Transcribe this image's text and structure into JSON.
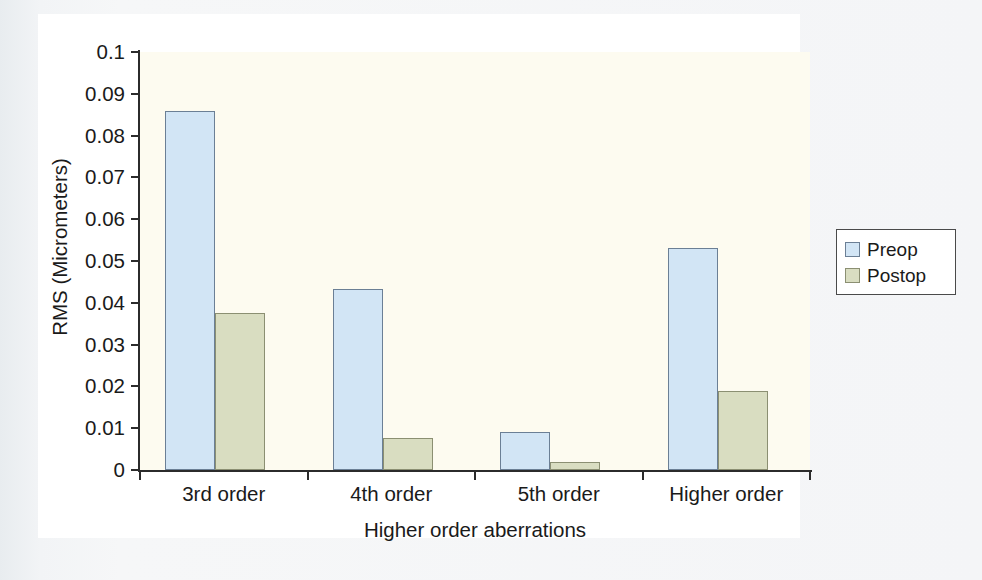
{
  "chart_data": {
    "type": "bar",
    "title": "",
    "xlabel": "Higher order aberrations",
    "ylabel": "RMS (Micrometers)",
    "categories": [
      "3rd order",
      "4th order",
      "5th order",
      "Higher order"
    ],
    "series": [
      {
        "name": "Preop",
        "color": "#d2e5f5",
        "values": [
          0.086,
          0.0433,
          0.009,
          0.053
        ]
      },
      {
        "name": "Postop",
        "color": "#d9ddc1",
        "values": [
          0.0375,
          0.0077,
          0.002,
          0.019
        ]
      }
    ],
    "ylim": [
      0,
      0.1
    ],
    "yticks": [
      "0",
      "0.01",
      "0.02",
      "0.03",
      "0.04",
      "0.05",
      "0.06",
      "0.07",
      "0.08",
      "0.09",
      "0.1"
    ],
    "ytick_values": [
      0,
      0.01,
      0.02,
      0.03,
      0.04,
      0.05,
      0.06,
      0.07,
      0.08,
      0.09,
      0.1
    ],
    "grid": false,
    "legend_position": "right-outside",
    "legend_entries": [
      "Preop",
      "Postop"
    ]
  },
  "axes": {
    "y_title": "RMS (Micrometers)",
    "x_title": "Higher order aberrations"
  },
  "legend": {
    "items": [
      {
        "label": "Preop"
      },
      {
        "label": "Postop"
      }
    ]
  }
}
